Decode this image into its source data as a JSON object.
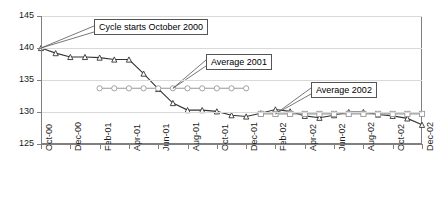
{
  "chart_data": {
    "type": "line",
    "title": "",
    "subtitle": "",
    "xlabel": "",
    "ylabel": "",
    "ylim": [
      125,
      145
    ],
    "ytick_labels": [
      "125",
      "130",
      "135",
      "140",
      "145"
    ],
    "ytick_values": [
      125,
      130,
      135,
      140,
      145
    ],
    "grid": true,
    "grid_axis": "y",
    "legend_position": "none",
    "x": [
      "Oct-00",
      "Nov-00",
      "Dec-00",
      "Jan-01",
      "Feb-01",
      "Mar-01",
      "Apr-01",
      "May-01",
      "Jun-01",
      "Jul-01",
      "Aug-01",
      "Sep-01",
      "Oct-01",
      "Nov-01",
      "Dec-01",
      "Jan-02",
      "Feb-02",
      "Mar-02",
      "Apr-02",
      "May-02",
      "Jun-02",
      "Jul-02",
      "Aug-02",
      "Sep-02",
      "Oct-02",
      "Nov-02",
      "Dec-02"
    ],
    "xtick_labels": [
      "Oct-00",
      "Dec-00",
      "Feb-01",
      "Apr-01",
      "Jun-01",
      "Aug-01",
      "Oct-01",
      "Dec-01",
      "Feb-02",
      "Apr-02",
      "Jun-02",
      "Aug-02",
      "Oct-02",
      "Dec-02"
    ],
    "xtick_indices": [
      0,
      2,
      4,
      6,
      8,
      10,
      12,
      14,
      16,
      18,
      20,
      22,
      24,
      26
    ],
    "series": [
      {
        "name": "Index",
        "marker": "triangle",
        "color": "#333333",
        "values": [
          140.0,
          139.2,
          138.6,
          138.6,
          138.5,
          138.2,
          138.2,
          136.0,
          133.6,
          131.4,
          130.3,
          130.3,
          130.1,
          129.5,
          129.3,
          129.8,
          130.4,
          130.1,
          129.4,
          129.1,
          129.5,
          130.0,
          130.0,
          129.6,
          129.4,
          129.0,
          128.0
        ]
      },
      {
        "name": "Average 2001",
        "marker": "circle",
        "color": "#999999",
        "start_index": 4,
        "end_index": 14,
        "value": 133.7
      },
      {
        "name": "Average 2002",
        "marker": "square",
        "color": "#999999",
        "start_index": 15,
        "end_index": 26,
        "value": 129.7
      }
    ],
    "annotations": [
      {
        "text": "Cycle starts October 2000",
        "target_index": 0,
        "target_value": 140.0
      },
      {
        "text": "Average 2001",
        "target_index": 9,
        "target_value": 133.7
      },
      {
        "text": "Average 2002",
        "target_index": 16,
        "target_value": 129.7
      }
    ]
  }
}
